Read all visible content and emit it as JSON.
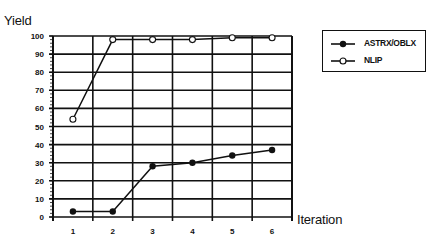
{
  "chart_data": {
    "type": "line",
    "title": "",
    "xlabel": "Iteration",
    "ylabel": "Yield",
    "x": [
      1,
      2,
      3,
      4,
      5,
      6
    ],
    "categories": [
      "1",
      "2",
      "3",
      "4",
      "5",
      "6"
    ],
    "yticks": [
      0,
      10,
      20,
      30,
      40,
      50,
      60,
      70,
      80,
      90,
      100
    ],
    "ylim": [
      0,
      100
    ],
    "grid": true,
    "legend_position": "right-top",
    "series": [
      {
        "name": "ASTRX/OBLX",
        "marker": "filled-circle",
        "color": "#111111",
        "values": [
          3,
          3,
          28,
          30,
          34,
          37
        ]
      },
      {
        "name": "NLIP",
        "marker": "open-circle",
        "color": "#111111",
        "values": [
          54,
          98,
          98,
          98,
          99,
          99
        ]
      }
    ]
  },
  "labels": {
    "y_title": "Yield",
    "x_title": "Iteration"
  },
  "legend": {
    "items": [
      {
        "label": "ASTRX/OBLX",
        "marker": "filled-circle"
      },
      {
        "label": "NLIP",
        "marker": "open-circle"
      }
    ]
  }
}
